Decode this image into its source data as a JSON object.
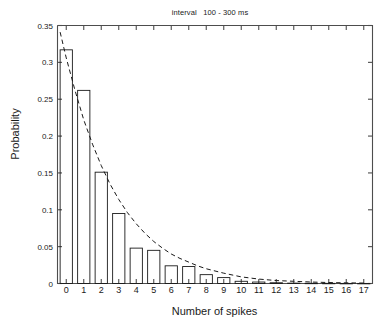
{
  "chart_data": {
    "type": "bar",
    "title": "interval   100 - 300 ms",
    "xlabel": "Number of spikes",
    "ylabel": "Probability",
    "categories": [
      "0",
      "1",
      "2",
      "3",
      "4",
      "5",
      "6",
      "7",
      "8",
      "9",
      "10",
      "11",
      "12",
      "13",
      "14",
      "15",
      "16",
      "17"
    ],
    "values": [
      0.317,
      0.262,
      0.151,
      0.095,
      0.048,
      0.045,
      0.024,
      0.023,
      0.012,
      0.008,
      0.003,
      0.002,
      0.001,
      0.0005,
      0.0003,
      0.0002,
      0.0001,
      0.0001
    ],
    "xlim": [
      -0.5,
      17.5
    ],
    "ylim": [
      0,
      0.35
    ],
    "ytick_values": [
      0,
      0.05,
      0.1,
      0.15,
      0.2,
      0.25,
      0.3,
      0.35
    ],
    "ytick_labels": [
      "0",
      "0.05",
      "0.1",
      "0.15",
      "0.2",
      "0.25",
      "0.3",
      "0.35"
    ],
    "xtick_values": [
      0,
      1,
      2,
      3,
      4,
      5,
      6,
      7,
      8,
      9,
      10,
      11,
      12,
      13,
      14,
      15,
      16,
      17
    ],
    "xtick_labels": [
      "0",
      "1",
      "2",
      "3",
      "4",
      "5",
      "6",
      "7",
      "8",
      "9",
      "10",
      "11",
      "12",
      "13",
      "14",
      "15",
      "16",
      "17"
    ],
    "grid": false,
    "legend": null,
    "series": [
      {
        "name": "histogram",
        "style": "bar",
        "fill": "none",
        "edge_color": "#000000",
        "values": [
          0.317,
          0.262,
          0.151,
          0.095,
          0.048,
          0.045,
          0.024,
          0.023,
          0.012,
          0.008,
          0.003,
          0.002,
          0.001,
          0.0005,
          0.0003,
          0.0002,
          0.0001,
          0.0001
        ]
      },
      {
        "name": "fit-curve",
        "style": "dashed-line",
        "color": "#000000",
        "x": [
          -0.35,
          0,
          0.5,
          1,
          1.5,
          2,
          2.5,
          3,
          3.5,
          4,
          4.5,
          5,
          5.5,
          6,
          6.5,
          7,
          7.5,
          8,
          9,
          10,
          11,
          12,
          13,
          14,
          15,
          16,
          17
        ],
        "y": [
          0.341,
          0.306,
          0.262,
          0.222,
          0.189,
          0.16,
          0.135,
          0.114,
          0.096,
          0.081,
          0.068,
          0.057,
          0.048,
          0.04,
          0.034,
          0.029,
          0.024,
          0.02,
          0.014,
          0.009,
          0.006,
          0.004,
          0.003,
          0.002,
          0.0013,
          0.0009,
          0.0006
        ]
      }
    ]
  },
  "colors": {
    "axis": "#4d4d4d",
    "bar_edge": "#1a1a1a",
    "curve": "#1a1a1a",
    "text": "#1a1a1a",
    "background": "#ffffff"
  }
}
